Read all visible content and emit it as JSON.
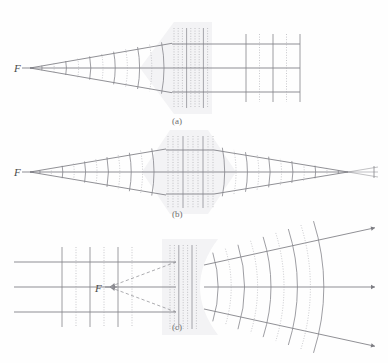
{
  "figure": {
    "width": 388,
    "height": 363,
    "background": "#fefefe"
  },
  "colors": {
    "ray": "#7c7c82",
    "wavefront_solid": "#85858b",
    "wavefront_dotted": "#a9a9ae",
    "virtual_ray_dashed": "#8a8a90",
    "lens_fill": "#e9e9ec",
    "lens_edge": "#dcdce0",
    "label_text": "#6d6d6d",
    "focus_text": "#4a4a4a"
  },
  "panels": [
    {
      "id": "panel-a",
      "label": "(a)",
      "label_x": 172,
      "label_y": 124,
      "lens_type": "plano-convex",
      "lens_description": "converging wedge lens, apex left, flat face right",
      "focus_label": "F",
      "focus_label_x": 14,
      "focus_label_y": 72,
      "focus_point_x": 30,
      "focus_point_y": 68,
      "axis_y": 68,
      "lens_left_x": 168,
      "lens_right_x": 212,
      "incoming": "diverging spherical wavefronts from point source F",
      "outgoing": "parallel rays with plane wavefronts",
      "n_rays": 3,
      "n_arcs_left": 11,
      "n_planes_right": 5
    },
    {
      "id": "panel-b",
      "label": "(b)",
      "label_x": 172,
      "label_y": 217,
      "lens_type": "biconvex",
      "lens_description": "converging biconvex lens, symmetric hexagonal outline",
      "focus_label": "F",
      "focus_label_x": 14,
      "focus_label_y": 176,
      "focus_point_x": 30,
      "focus_point_y": 172,
      "axis_y": 172,
      "lens_left_x": 160,
      "lens_right_x": 218,
      "incoming": "diverging spherical wavefronts from point source F",
      "outgoing": "converging spherical wavefronts to image point",
      "image_point_x": 348,
      "n_rays": 3,
      "n_arcs_left": 11,
      "n_arcs_right": 11
    },
    {
      "id": "panel-c",
      "label": "(c)",
      "label_x": 172,
      "label_y": 330,
      "lens_type": "biconcave",
      "lens_description": "diverging lens, concave face on right",
      "focus_label": "F",
      "focus_label_x": 95,
      "focus_label_y": 292,
      "focus_point_x": 103,
      "focus_point_y": 287,
      "axis_y": 287,
      "lens_left_x": 168,
      "lens_right_x": 214,
      "incoming": "parallel rays with plane wavefronts",
      "outgoing": "diverging spherical wavefronts, virtual focus F",
      "virtual_rays": "dashed lines traced back from lens to virtual focus F",
      "n_rays": 3,
      "n_planes_left": 6,
      "n_arcs_right": 9
    }
  ],
  "annotations": {
    "wavefront_style_note": "alternating solid and dotted arcs/lines represent successive wave crests",
    "lens_interior_note": "closely spaced dotted lines inside lens show shortened wavelength in glass"
  }
}
